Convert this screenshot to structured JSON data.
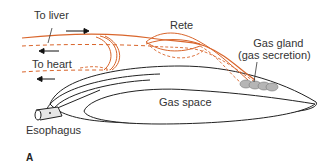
{
  "diagram": {
    "panel_letter": "A",
    "labels": {
      "to_liver": "To liver",
      "to_heart": "To heart",
      "rete": "Rete",
      "gas_gland_line1": "Gas gland",
      "gas_gland_line2": "(gas secretion)",
      "gas_space": "Gas space",
      "esophagus": "Esophagus"
    },
    "colors": {
      "artery": "#d9652b",
      "vein_dashed": "#d9652b",
      "outline": "#222222",
      "gland_fill": "#b5b5b5",
      "arrow": "#111111"
    }
  }
}
